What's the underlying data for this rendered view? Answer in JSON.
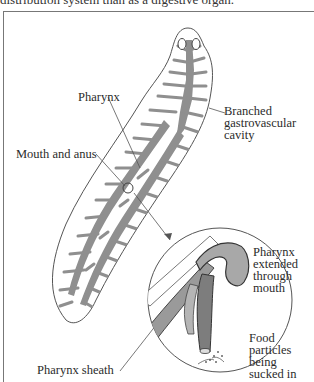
{
  "caption": "distribution system than as a digestive organ.",
  "figure": {
    "labels": {
      "pharynx": "Pharynx",
      "mouth_and_anus": "Mouth and anus",
      "gastrovascular": [
        "Branched",
        "gastrovascular",
        "cavity"
      ],
      "pharynx_extended": [
        "Pharynx",
        "extended",
        "through",
        "mouth"
      ],
      "food_particles": [
        "Food",
        "particles",
        "being",
        "sucked in"
      ],
      "pharynx_sheath": "Pharynx sheath"
    },
    "colors": {
      "cavity_gray": "#8f8f8f",
      "outline": "#555555",
      "leader_line": "#555555",
      "background": "#ffffff"
    }
  }
}
